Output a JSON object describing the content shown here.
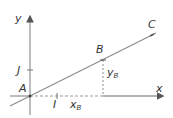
{
  "diagram": {
    "type": "coordinate-plane-line",
    "colors": {
      "axis": "#9a9a9a",
      "line": "#8a8a8a",
      "dashed": "#9a9a9a",
      "text": "#333333",
      "background": "#ffffff"
    },
    "axes": {
      "x_label": "x",
      "y_label": "y"
    },
    "points": {
      "origin": {
        "label": "A"
      },
      "unit_x": {
        "label": "I"
      },
      "unit_y": {
        "label": "J"
      },
      "b": {
        "label": "B"
      },
      "c": {
        "label": "C"
      }
    },
    "coordinates": {
      "xb_main": "x",
      "xb_sub": "B",
      "yb_main": "y",
      "yb_sub": "B"
    }
  }
}
